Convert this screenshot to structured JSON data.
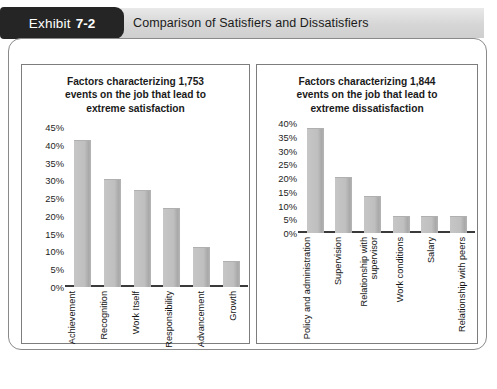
{
  "exhibit": {
    "label": "Exhibit",
    "number": "7-2",
    "title": "Comparison of Satisfiers and Dissatisfiers"
  },
  "colors": {
    "tab_background": "#252525",
    "header_background": "#d6d6d6",
    "bar_fill": "#bfbfbf",
    "frame_border": "#8a8a8a",
    "panel_border": "#7d7d7d",
    "axis_line": "#3a3a3a",
    "text": "#1a1a1a"
  },
  "chart_data": [
    {
      "type": "bar",
      "id": "satisfiers",
      "title": "Factors characterizing 1,753\nevents on the job that lead to\nextreme satisfaction",
      "categories": [
        "Achievement",
        "Recognition",
        "Work Itself",
        "Responsibility",
        "Advancement",
        "Growth"
      ],
      "values": [
        41,
        30,
        27,
        22,
        11,
        7
      ],
      "xlabel": "",
      "ylabel": "",
      "ylim": [
        0,
        45
      ],
      "yticks": [
        45,
        40,
        35,
        30,
        25,
        20,
        15,
        10,
        5,
        0
      ],
      "ytick_labels": [
        "45%",
        "40%",
        "35%",
        "30%",
        "25%",
        "20%",
        "15%",
        "10%",
        "5%",
        "0%"
      ],
      "grid": false,
      "legend": null
    },
    {
      "type": "bar",
      "id": "dissatisfiers",
      "title": "Factors characterizing 1,844\nevents on the job that lead to\nextreme dissatisfaction",
      "categories": [
        "Policy and administration",
        "Supervision",
        "Relationship with\nsupervisor",
        "Work conditions",
        "Salary",
        "Relationship with peers"
      ],
      "values": [
        38,
        20,
        13,
        6,
        6,
        6
      ],
      "xlabel": "",
      "ylabel": "",
      "ylim": [
        0,
        40
      ],
      "yticks": [
        40,
        35,
        30,
        25,
        20,
        15,
        10,
        5,
        0
      ],
      "ytick_labels": [
        "40%",
        "35%",
        "30%",
        "25%",
        "20%",
        "15%",
        "10%",
        "5%",
        "0%"
      ],
      "grid": false,
      "legend": null
    }
  ]
}
